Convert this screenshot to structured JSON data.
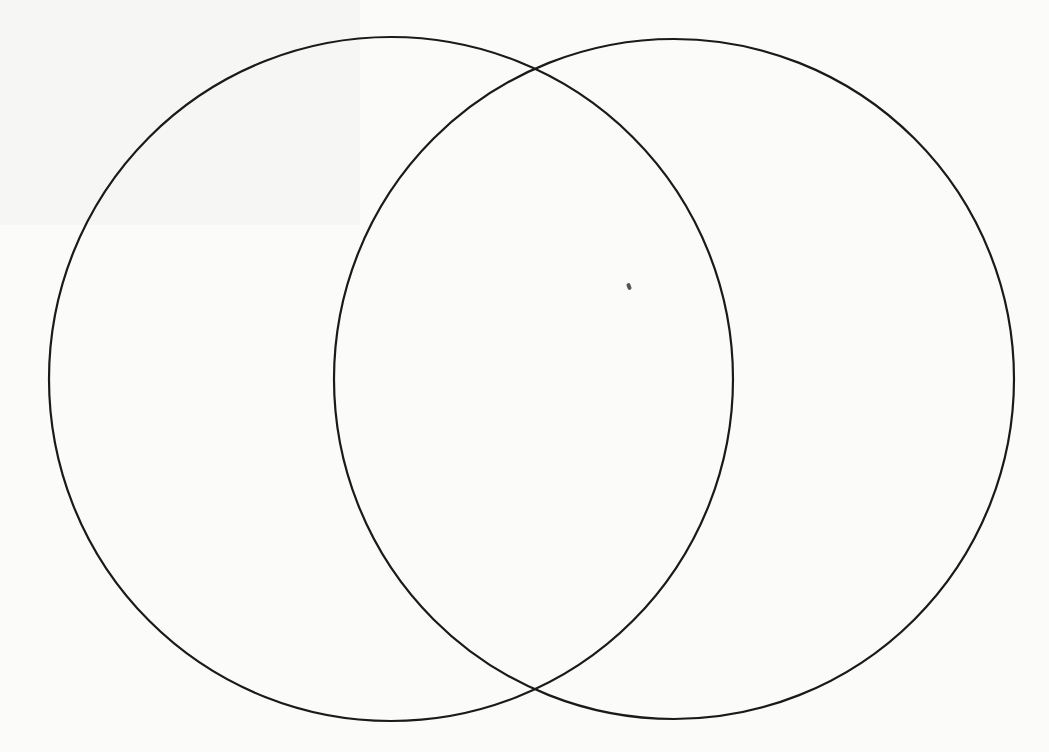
{
  "diagram": {
    "type": "venn",
    "set_count": 2,
    "stroke_color": "#1a1a1a",
    "background_color": "#fbfbfa",
    "circles": [
      {
        "id": "left",
        "cx": 391,
        "cy": 379,
        "r": 342
      },
      {
        "id": "right",
        "cx": 674,
        "cy": 379,
        "r": 340
      }
    ],
    "labels": []
  }
}
